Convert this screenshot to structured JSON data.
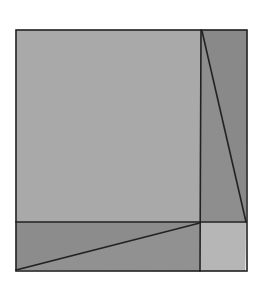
{
  "diagram": {
    "type": "geometric-dissection",
    "outer_square": {
      "x1": 16,
      "y1": 30,
      "x2": 247,
      "y2": 271
    },
    "dividers": {
      "vertical_x": 201,
      "horizontal_y": 222
    },
    "regions": [
      {
        "name": "large-square",
        "points": "16,30 201,30 201,222 16,222",
        "fill": "#a9a9a9"
      },
      {
        "name": "right-strip-left-triangle",
        "points": "201,30 201,222 246,222",
        "fill": "#8e8e8e"
      },
      {
        "name": "right-strip-right-triangle",
        "points": "201,30 247,30 246,222",
        "fill": "#898989"
      },
      {
        "name": "bottom-strip-upper-triangle",
        "points": "16,222 201,222 16,270",
        "fill": "#8c8c8c"
      },
      {
        "name": "bottom-strip-lower-triangle",
        "points": "201,222 200,271 16,270",
        "fill": "#919191"
      },
      {
        "name": "small-square",
        "points": "201,222 246,222 245,271 200,271",
        "fill": "#b6b6b6"
      }
    ],
    "lines": [
      {
        "name": "right-strip-diagonal",
        "x1": 202,
        "y1": 31,
        "x2": 246,
        "y2": 222
      },
      {
        "name": "bottom-strip-diagonal",
        "x1": 16,
        "y1": 270,
        "x2": 200,
        "y2": 223
      },
      {
        "name": "vertical-divider",
        "x1": 201,
        "y1": 30,
        "x2": 200,
        "y2": 271
      },
      {
        "name": "horizontal-divider",
        "x1": 16,
        "y1": 222,
        "x2": 246,
        "y2": 222
      }
    ],
    "stroke_color": "#222222",
    "stroke_width": 1.6
  }
}
